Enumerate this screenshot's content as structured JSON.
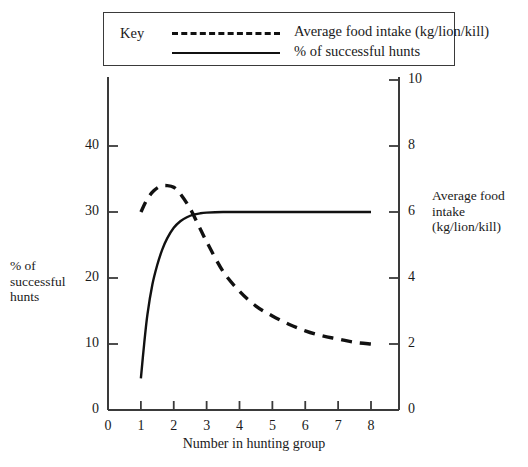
{
  "legend": {
    "key_label": "Key",
    "entries": [
      {
        "label": "Average food intake (kg/lion/kill)",
        "style": "dashed"
      },
      {
        "label": "% of successful hunts",
        "style": "solid"
      }
    ]
  },
  "chart_data": {
    "type": "line",
    "title": "",
    "xlabel": "Number in hunting group",
    "ylabel": "% of\nsuccessful\nhunts",
    "ylabel_left": "% of successful hunts",
    "ylabel_right": "Average food intake (kg/lion/kill)",
    "xlim": [
      0,
      8
    ],
    "xticks": [
      0,
      1,
      2,
      3,
      4,
      5,
      6,
      7,
      8
    ],
    "xtick_labels": [
      "0",
      "1",
      "2",
      "3",
      "4",
      "5",
      "6",
      "7",
      "8"
    ],
    "ylim_left": [
      0,
      40
    ],
    "yticks_left": [
      0,
      10,
      20,
      30,
      40
    ],
    "ytick_labels_left": [
      "0",
      "10",
      "20",
      "30",
      "40"
    ],
    "ylim_right": [
      0,
      10
    ],
    "yticks_right": [
      0,
      2,
      4,
      6,
      8,
      10
    ],
    "ytick_labels_right": [
      "0",
      "2",
      "4",
      "6",
      "8",
      "10"
    ],
    "grid": false,
    "legend_position": "top",
    "series": [
      {
        "name": "% of successful hunts",
        "style": "solid",
        "axis": "left",
        "units": "%",
        "x": [
          1.0,
          1.1,
          1.2,
          1.35,
          1.5,
          1.65,
          1.8,
          2.0,
          2.2,
          2.4,
          2.6,
          2.8,
          3.0,
          3.5,
          4.0,
          5.0,
          6.0,
          7.0,
          8.0
        ],
        "values": [
          4.8,
          10.0,
          14.5,
          19.0,
          22.0,
          24.3,
          26.0,
          27.6,
          28.6,
          29.2,
          29.6,
          29.8,
          29.9,
          30.0,
          30.0,
          30.0,
          30.0,
          30.0,
          30.0
        ]
      },
      {
        "name": "Average food intake (kg/lion/kill)",
        "style": "dashed",
        "axis": "right",
        "units": "kg/lion/kill",
        "x": [
          1.0,
          1.2,
          1.4,
          1.6,
          1.8,
          2.0,
          2.2,
          2.5,
          2.8,
          3.0,
          3.5,
          4.0,
          4.5,
          5.0,
          5.5,
          6.0,
          6.5,
          7.0,
          7.5,
          8.0
        ],
        "values": [
          6.0,
          6.4,
          6.65,
          6.78,
          6.8,
          6.75,
          6.55,
          6.1,
          5.5,
          5.1,
          4.2,
          3.6,
          3.15,
          2.85,
          2.6,
          2.4,
          2.25,
          2.15,
          2.05,
          2.0
        ]
      }
    ],
    "colors": {
      "line": "#111111",
      "axis": "#3a3a3a",
      "background": "#ffffff"
    }
  }
}
